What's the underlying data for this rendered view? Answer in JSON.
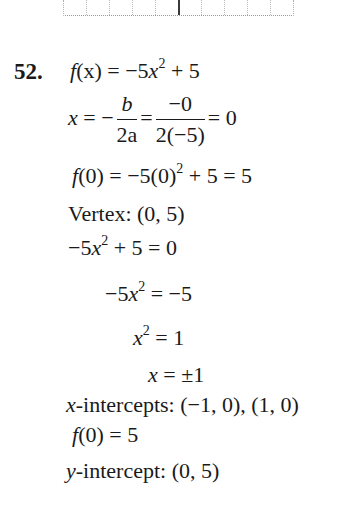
{
  "problem_number": "52.",
  "graph_fragment": {
    "description": "bottom edge of dotted coordinate grid with y-axis",
    "grid_columns": 10
  },
  "lines": {
    "function": {
      "lhs": "f",
      "lhs_arg": "(x)",
      "eq": " = −5",
      "var": "x",
      "exp": "2",
      "rest": " + 5"
    },
    "vertex_x": {
      "lhs": "x",
      "eq1": " = −",
      "frac1_num": "b",
      "frac1_den": "2a",
      "eq2": "=",
      "frac2_num": "−0",
      "frac2_den": "2(−5)",
      "result": "= 0"
    },
    "f_at_zero": {
      "f": "f",
      "text1": "(0) = −5(0)",
      "exp": "2",
      "text2": " + 5 = 5"
    },
    "vertex": "Vertex: (0, 5)",
    "set_zero": {
      "text1": "−5",
      "var": "x",
      "exp": "2",
      "text2": " + 5 = 0"
    },
    "isolate": {
      "text1": "−5",
      "var": "x",
      "exp": "2",
      "text2": " = −5"
    },
    "x_squared": {
      "var": "x",
      "exp": "2",
      "text2": " = 1"
    },
    "x_solution": {
      "var": "x",
      "text2": " = ±1"
    },
    "x_intercepts": {
      "var": "x",
      "text": "-intercepts: (−1, 0), (1, 0)"
    },
    "f0_again": {
      "f": "f",
      "text": "(0) = 5"
    },
    "y_intercept": {
      "var": "y",
      "text": "-intercept: (0, 5)"
    }
  }
}
